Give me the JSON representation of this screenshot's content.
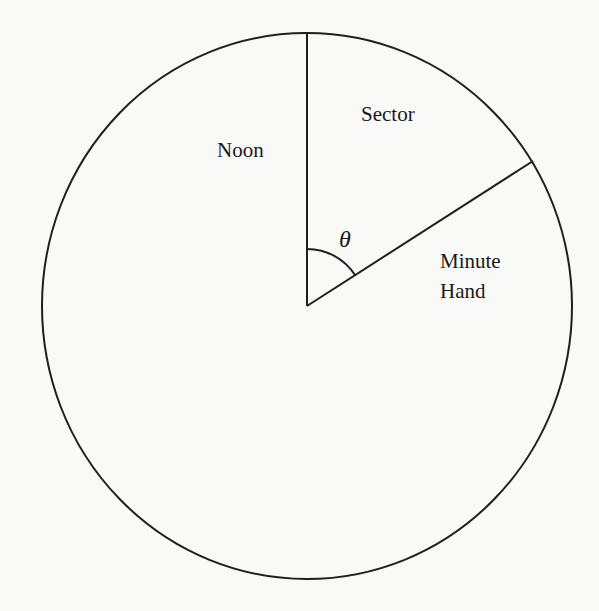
{
  "diagram": {
    "type": "clock-sector",
    "colors": {
      "background": "#f9f9f8",
      "stroke": "#1f1f1f",
      "text": "#1a1a1a"
    },
    "circle": {
      "cx": 307,
      "cy": 306,
      "rx": 265,
      "ry": 273
    },
    "noon_line": {
      "x1": 307,
      "y1": 306,
      "x2": 307,
      "y2": 33
    },
    "minute_hand": {
      "x1": 307,
      "y1": 306,
      "x2": 533,
      "y2": 161
    },
    "angle_arc": {
      "path": "M 307 249 A 57 57 0 0 1 355 275"
    },
    "labels": {
      "noon": "Noon",
      "sector": "Sector",
      "minute_line1": "Minute",
      "minute_line2": "Hand",
      "angle": "θ"
    }
  }
}
